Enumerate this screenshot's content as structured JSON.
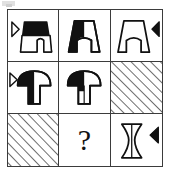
{
  "puzzle": {
    "type": "matrix-reasoning-3x3",
    "artifact_label": "",
    "question_mark": "?",
    "colors": {
      "ink": "#111111",
      "grid_line": "#3b3b3b",
      "fill_black": "#111111",
      "fill_white": "#ffffff",
      "hatch": "#3b3b3b",
      "background": "#ffffff"
    },
    "grid": {
      "rows": 3,
      "columns": 3,
      "cells": [
        {
          "id": "cell-r1c1",
          "row": 1,
          "column": 1,
          "shape": "arch",
          "shape_label": "arch-shape",
          "fill": "full-black",
          "marker": "outlined-right-triangle",
          "marker_side": "left",
          "hatched": false,
          "is_answer_slot": false
        },
        {
          "id": "cell-r1c2",
          "row": 1,
          "column": 2,
          "shape": "arch",
          "shape_label": "arch-shape",
          "fill": "left-half-black",
          "marker": "none",
          "marker_side": "none",
          "hatched": false,
          "is_answer_slot": false
        },
        {
          "id": "cell-r1c3",
          "row": 1,
          "column": 3,
          "shape": "arch",
          "shape_label": "arch-shape",
          "fill": "white",
          "marker": "filled-left-triangle",
          "marker_side": "right",
          "hatched": false,
          "is_answer_slot": false
        },
        {
          "id": "cell-r2c1",
          "row": 2,
          "column": 1,
          "shape": "mushroom",
          "shape_label": "mushroom-shape",
          "fill": "left-half-black",
          "marker": "outlined-right-triangle",
          "marker_side": "left",
          "hatched": false,
          "is_answer_slot": false
        },
        {
          "id": "cell-r2c2",
          "row": 2,
          "column": 2,
          "shape": "mushroom",
          "shape_label": "mushroom-shape",
          "fill": "cap-left-black",
          "marker": "none",
          "marker_side": "none",
          "hatched": false,
          "is_answer_slot": false
        },
        {
          "id": "cell-r2c3",
          "row": 2,
          "column": 3,
          "shape": "none",
          "shape_label": "diagonal-hatch-fill",
          "fill": "none",
          "marker": "none",
          "marker_side": "none",
          "hatched": true,
          "is_answer_slot": false
        },
        {
          "id": "cell-r3c1",
          "row": 3,
          "column": 1,
          "shape": "none",
          "shape_label": "diagonal-hatch-fill",
          "fill": "none",
          "marker": "none",
          "marker_side": "none",
          "hatched": true,
          "is_answer_slot": false
        },
        {
          "id": "cell-r3c2",
          "row": 3,
          "column": 2,
          "shape": "question-mark",
          "shape_label": "question-mark",
          "fill": "none",
          "marker": "none",
          "marker_side": "none",
          "hatched": false,
          "is_answer_slot": true
        },
        {
          "id": "cell-r3c3",
          "row": 3,
          "column": 3,
          "shape": "spool",
          "shape_label": "spool-hourglass-shape",
          "fill": "white-with-center-line",
          "marker": "filled-left-triangle",
          "marker_side": "right",
          "hatched": false,
          "is_answer_slot": false
        }
      ]
    }
  }
}
